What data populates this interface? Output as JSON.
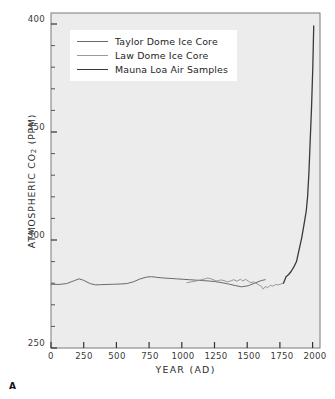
{
  "figure": {
    "panel_letter": "A",
    "background_color": "#ffffff",
    "plot_background_color": "#ececec",
    "frame_color": "#7a7a7a"
  },
  "legend": {
    "position": "top-left-inside",
    "background_color": "#ffffff",
    "entries": [
      {
        "label": "Taylor Dome Ice Core",
        "color": "#6a6a6a",
        "line_width": 1.0
      },
      {
        "label": "Law Dome Ice Core",
        "color": "#8e8e8e",
        "line_width": 0.9
      },
      {
        "label": "Mauna Loa Air Samples",
        "color": "#3a3a3a",
        "line_width": 1.3
      }
    ]
  },
  "axes": {
    "x": {
      "label": "YEAR (AD)",
      "min": 0,
      "max": 2060,
      "ticks": [
        0,
        250,
        500,
        750,
        1000,
        1250,
        1500,
        1750,
        2000
      ],
      "tick_labels": [
        "0",
        "250",
        "500",
        "750",
        "1000",
        "1250",
        "1500",
        "1750",
        "2000"
      ]
    },
    "y": {
      "label_text": "ATMOSPHERIC CO",
      "label_sub": "2",
      "label_unit": " (PPM)",
      "label_full": "ATMOSPHERIC CO2 (PPM)",
      "min": 250,
      "max": 405,
      "major_ticks": [
        250,
        300,
        350,
        400
      ],
      "major_tick_labels": [
        "250",
        "300",
        "350",
        "400"
      ],
      "minor_tick_step": 10
    },
    "grid": false
  },
  "chart_data": {
    "type": "line",
    "title": "",
    "xlabel": "YEAR (AD)",
    "ylabel": "ATMOSPHERIC CO2 (PPM)",
    "xlim": [
      0,
      2060
    ],
    "ylim": [
      250,
      405
    ],
    "grid": false,
    "legend_position": "upper left",
    "series": [
      {
        "name": "Taylor Dome Ice Core",
        "color": "#6a6a6a",
        "x": [
          0,
          60,
          120,
          180,
          215,
          250,
          300,
          340,
          380,
          430,
          480,
          530,
          580,
          630,
          680,
          730,
          770,
          810,
          860,
          910,
          960,
          1010,
          1060,
          1110,
          1160,
          1210,
          1260,
          1310,
          1360,
          1410,
          1460,
          1510,
          1560,
          1610,
          1640
        ],
        "y": [
          279.5,
          279.4,
          279.8,
          281.2,
          282.0,
          281.3,
          279.8,
          279.2,
          279.3,
          279.4,
          279.5,
          279.6,
          279.8,
          280.6,
          281.9,
          282.8,
          283.0,
          282.7,
          282.4,
          282.2,
          282.0,
          281.8,
          281.6,
          281.4,
          281.2,
          281.0,
          280.7,
          280.2,
          279.6,
          278.9,
          278.3,
          278.8,
          280.0,
          281.2,
          281.6
        ]
      },
      {
        "name": "Law Dome Ice Core",
        "color": "#8e8e8e",
        "x": [
          1040,
          1075,
          1110,
          1145,
          1180,
          1200,
          1225,
          1250,
          1275,
          1300,
          1325,
          1350,
          1375,
          1400,
          1425,
          1450,
          1470,
          1490,
          1510,
          1530,
          1550,
          1570,
          1590,
          1610,
          1625,
          1640,
          1660,
          1680,
          1700,
          1720,
          1740,
          1760,
          1780
        ],
        "y": [
          280.2,
          280.6,
          281.0,
          281.5,
          282.0,
          282.4,
          282.0,
          281.4,
          281.0,
          281.5,
          281.2,
          280.6,
          281.0,
          281.6,
          280.9,
          281.8,
          281.0,
          281.8,
          281.0,
          280.2,
          280.6,
          280.0,
          279.2,
          278.6,
          277.2,
          278.4,
          278.0,
          279.0,
          278.6,
          279.4,
          279.2,
          279.6,
          280.0
        ]
      },
      {
        "name": "Mauna Loa Air Samples",
        "color": "#3a3a3a",
        "x": [
          1780,
          1800,
          1820,
          1840,
          1860,
          1880,
          1900,
          1920,
          1940,
          1955,
          1965,
          1975,
          1985,
          1995,
          2005,
          2012
        ],
        "y": [
          280.0,
          283.0,
          284.0,
          285.5,
          287.5,
          290.0,
          295.5,
          301.0,
          308.0,
          313.5,
          320.0,
          331.0,
          346.0,
          361.0,
          380.0,
          399.0
        ]
      }
    ],
    "annotations": [
      {
        "text": "A",
        "role": "panel-letter"
      }
    ]
  }
}
